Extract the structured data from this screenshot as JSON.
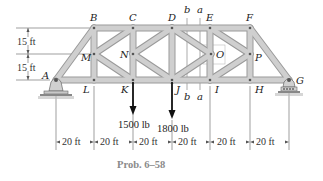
{
  "figure": {
    "caption": "Prob. 6–58",
    "joints": {
      "A": {
        "label": "A",
        "x": 56,
        "y": 80
      },
      "B": {
        "label": "B",
        "x": 94,
        "y": 28
      },
      "C": {
        "label": "C",
        "x": 133,
        "y": 28
      },
      "D": {
        "label": "D",
        "x": 172,
        "y": 28
      },
      "E": {
        "label": "E",
        "x": 210,
        "y": 28
      },
      "F": {
        "label": "F",
        "x": 250,
        "y": 28
      },
      "G": {
        "label": "G",
        "x": 289,
        "y": 80
      },
      "H": {
        "label": "H",
        "x": 250,
        "y": 80
      },
      "I": {
        "label": "I",
        "x": 210,
        "y": 80
      },
      "J": {
        "label": "J",
        "x": 172,
        "y": 80
      },
      "K": {
        "label": "K",
        "x": 133,
        "y": 80
      },
      "L": {
        "label": "L",
        "x": 94,
        "y": 80
      },
      "M": {
        "label": "M",
        "x": 94,
        "y": 54
      },
      "N": {
        "label": "N",
        "x": 133,
        "y": 54
      },
      "O": {
        "label": "O",
        "x": 211,
        "y": 54
      },
      "P": {
        "label": "P",
        "x": 250,
        "y": 54
      }
    },
    "loads": [
      {
        "joint": "K",
        "label": "1500 lb"
      },
      {
        "joint": "J",
        "label": "1800 lb"
      }
    ],
    "vertical_dims": [
      "15 ft",
      "15 ft"
    ],
    "horizontal_dims": [
      "20 ft",
      "20 ft",
      "20 ft",
      "20 ft",
      "20 ft",
      "20 ft"
    ],
    "section_lines": [
      {
        "name": "b",
        "label_top": "b",
        "label_bottom": "b"
      },
      {
        "name": "a",
        "label_top": "a",
        "label_bottom": "a"
      }
    ]
  }
}
